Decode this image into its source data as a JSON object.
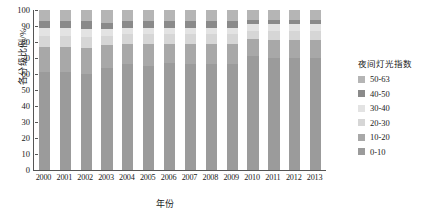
{
  "chart_data": {
    "type": "bar",
    "title": "",
    "xlabel": "年份",
    "ylabel": "各分级比例/%",
    "ylim": [
      0,
      100
    ],
    "yticks": [
      0,
      10,
      20,
      30,
      40,
      50,
      60,
      70,
      80,
      90,
      100
    ],
    "grid": false,
    "stacked": true,
    "stack_mode": "percent",
    "legend_title": "夜间灯光指数",
    "legend_position": "right",
    "categories": [
      "2000",
      "2001",
      "2002",
      "2003",
      "2004",
      "2005",
      "2006",
      "2007",
      "2008",
      "2009",
      "2010",
      "2011",
      "2012",
      "2013"
    ],
    "series": [
      {
        "name": "0-10",
        "color": "#9b9b9b",
        "values": [
          61,
          61,
          60,
          64,
          66,
          65,
          67,
          66,
          66,
          66,
          71,
          70,
          70,
          70
        ]
      },
      {
        "name": "10-20",
        "color": "#a8a8a8",
        "values": [
          16,
          16,
          16,
          14,
          13,
          14,
          12,
          13,
          13,
          13,
          11,
          11,
          11,
          11
        ]
      },
      {
        "name": "20-30",
        "color": "#d6d6d6",
        "values": [
          7,
          7,
          7,
          6,
          6,
          6,
          6,
          6,
          6,
          6,
          5,
          6,
          6,
          6
        ]
      },
      {
        "name": "30-40",
        "color": "#e3e3e3",
        "values": [
          5,
          5,
          5,
          4,
          4,
          4,
          4,
          4,
          4,
          4,
          4,
          4,
          4,
          4
        ]
      },
      {
        "name": "40-50",
        "color": "#8a8a8a",
        "values": [
          4,
          4,
          5,
          4,
          4,
          4,
          4,
          4,
          4,
          4,
          3,
          3,
          3,
          3
        ]
      },
      {
        "name": "50-63",
        "color": "#b5b5b5",
        "values": [
          7,
          7,
          7,
          8,
          7,
          7,
          7,
          7,
          7,
          7,
          6,
          6,
          6,
          6
        ]
      }
    ],
    "legend_entries": [
      {
        "label": "50-63",
        "color": "#b5b5b5"
      },
      {
        "label": "40-50",
        "color": "#8a8a8a"
      },
      {
        "label": "30-40",
        "color": "#e3e3e3"
      },
      {
        "label": "20-30",
        "color": "#d6d6d6"
      },
      {
        "label": "10-20",
        "color": "#a8a8a8"
      },
      {
        "label": "0-10",
        "color": "#9b9b9b"
      }
    ]
  }
}
